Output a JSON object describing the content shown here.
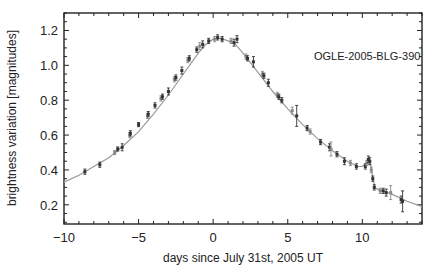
{
  "chart_data": {
    "type": "scatter",
    "title": "",
    "annotation": "OGLE-2005-BLG-390",
    "xlabel": "days since July 31st, 2005 UT",
    "ylabel": "brightness variation [magnitudes]",
    "xlim": [
      -10,
      14
    ],
    "ylim": [
      0.09,
      1.3
    ],
    "xticks": [
      -10,
      -5,
      0,
      5,
      10
    ],
    "xtick_labels": [
      "−10",
      "−5",
      "0",
      "5",
      "10"
    ],
    "yticks": [
      0.2,
      0.4,
      0.6,
      0.8,
      1.0,
      1.2
    ],
    "ytick_labels": [
      "0.2",
      "0.4",
      "0.6",
      "0.8",
      "1.0",
      "1.2"
    ],
    "grid": false,
    "legend": null,
    "series": [
      {
        "name": "observations",
        "style": "points with error bars",
        "points": [
          {
            "x": -8.6,
            "y": 0.39,
            "err": 0.015
          },
          {
            "x": -7.6,
            "y": 0.43,
            "err": 0.015
          },
          {
            "x": -6.6,
            "y": 0.5,
            "err": 0.012
          },
          {
            "x": -6.4,
            "y": 0.52,
            "err": 0.012
          },
          {
            "x": -6.1,
            "y": 0.53,
            "err": 0.02
          },
          {
            "x": -5.6,
            "y": 0.6,
            "err": 0.015
          },
          {
            "x": -5.55,
            "y": 0.61,
            "err": 0.015
          },
          {
            "x": -5.0,
            "y": 0.66,
            "err": 0.012
          },
          {
            "x": -4.4,
            "y": 0.71,
            "err": 0.015
          },
          {
            "x": -4.35,
            "y": 0.72,
            "err": 0.015
          },
          {
            "x": -3.9,
            "y": 0.77,
            "err": 0.015
          },
          {
            "x": -3.5,
            "y": 0.81,
            "err": 0.015
          },
          {
            "x": -3.4,
            "y": 0.82,
            "err": 0.015
          },
          {
            "x": -3.0,
            "y": 0.85,
            "err": 0.02
          },
          {
            "x": -2.6,
            "y": 0.92,
            "err": 0.015
          },
          {
            "x": -2.5,
            "y": 0.93,
            "err": 0.015
          },
          {
            "x": -2.1,
            "y": 0.97,
            "err": 0.02
          },
          {
            "x": -1.7,
            "y": 1.03,
            "err": 0.015
          },
          {
            "x": -1.6,
            "y": 1.04,
            "err": 0.015
          },
          {
            "x": -1.1,
            "y": 1.09,
            "err": 0.015
          },
          {
            "x": -0.9,
            "y": 1.11,
            "err": 0.02
          },
          {
            "x": -0.7,
            "y": 1.12,
            "err": 0.02
          },
          {
            "x": -0.3,
            "y": 1.14,
            "err": 0.015
          },
          {
            "x": 0.1,
            "y": 1.15,
            "err": 0.015
          },
          {
            "x": 0.3,
            "y": 1.16,
            "err": 0.015
          },
          {
            "x": 0.6,
            "y": 1.15,
            "err": 0.015
          },
          {
            "x": 1.2,
            "y": 1.14,
            "err": 0.015
          },
          {
            "x": 1.4,
            "y": 1.13,
            "err": 0.02
          },
          {
            "x": 1.6,
            "y": 1.15,
            "err": 0.02
          },
          {
            "x": 2.2,
            "y": 1.05,
            "err": 0.015
          },
          {
            "x": 2.3,
            "y": 1.04,
            "err": 0.015
          },
          {
            "x": 2.7,
            "y": 1.02,
            "err": 0.03
          },
          {
            "x": 3.3,
            "y": 0.95,
            "err": 0.015
          },
          {
            "x": 3.4,
            "y": 0.94,
            "err": 0.015
          },
          {
            "x": 3.7,
            "y": 0.9,
            "err": 0.02
          },
          {
            "x": 4.3,
            "y": 0.83,
            "err": 0.015
          },
          {
            "x": 4.4,
            "y": 0.82,
            "err": 0.015
          },
          {
            "x": 4.6,
            "y": 0.8,
            "err": 0.015
          },
          {
            "x": 5.3,
            "y": 0.74,
            "err": 0.02
          },
          {
            "x": 5.6,
            "y": 0.71,
            "err": 0.06
          },
          {
            "x": 6.3,
            "y": 0.64,
            "err": 0.015
          },
          {
            "x": 6.5,
            "y": 0.62,
            "err": 0.015
          },
          {
            "x": 7.2,
            "y": 0.56,
            "err": 0.015
          },
          {
            "x": 7.8,
            "y": 0.53,
            "err": 0.02
          },
          {
            "x": 7.9,
            "y": 0.52,
            "err": 0.04
          },
          {
            "x": 8.3,
            "y": 0.49,
            "err": 0.015
          },
          {
            "x": 8.8,
            "y": 0.45,
            "err": 0.02
          },
          {
            "x": 9.2,
            "y": 0.44,
            "err": 0.015
          },
          {
            "x": 9.6,
            "y": 0.42,
            "err": 0.015
          },
          {
            "x": 10.2,
            "y": 0.42,
            "err": 0.015
          },
          {
            "x": 10.3,
            "y": 0.44,
            "err": 0.015
          },
          {
            "x": 10.4,
            "y": 0.46,
            "err": 0.02
          },
          {
            "x": 10.5,
            "y": 0.45,
            "err": 0.02
          },
          {
            "x": 10.6,
            "y": 0.4,
            "err": 0.015
          },
          {
            "x": 10.7,
            "y": 0.35,
            "err": 0.015
          },
          {
            "x": 10.8,
            "y": 0.3,
            "err": 0.015
          },
          {
            "x": 11.2,
            "y": 0.28,
            "err": 0.015
          },
          {
            "x": 11.4,
            "y": 0.28,
            "err": 0.015
          },
          {
            "x": 11.6,
            "y": 0.27,
            "err": 0.02
          },
          {
            "x": 11.9,
            "y": 0.27,
            "err": 0.04
          },
          {
            "x": 12.6,
            "y": 0.23,
            "err": 0.02
          },
          {
            "x": 12.7,
            "y": 0.22,
            "err": 0.06
          }
        ]
      },
      {
        "name": "model fit",
        "style": "line",
        "color": "#9a9a9a",
        "points": [
          {
            "x": -10,
            "y": 0.33
          },
          {
            "x": -9,
            "y": 0.37
          },
          {
            "x": -8,
            "y": 0.42
          },
          {
            "x": -7,
            "y": 0.47
          },
          {
            "x": -6,
            "y": 0.54
          },
          {
            "x": -5,
            "y": 0.62
          },
          {
            "x": -4,
            "y": 0.72
          },
          {
            "x": -3,
            "y": 0.83
          },
          {
            "x": -2,
            "y": 0.95
          },
          {
            "x": -1,
            "y": 1.07
          },
          {
            "x": -0.5,
            "y": 1.12
          },
          {
            "x": 0,
            "y": 1.15
          },
          {
            "x": 0.5,
            "y": 1.155
          },
          {
            "x": 1,
            "y": 1.14
          },
          {
            "x": 1.5,
            "y": 1.12
          },
          {
            "x": 2,
            "y": 1.07
          },
          {
            "x": 3,
            "y": 0.96
          },
          {
            "x": 4,
            "y": 0.85
          },
          {
            "x": 5,
            "y": 0.75
          },
          {
            "x": 6,
            "y": 0.66
          },
          {
            "x": 7,
            "y": 0.58
          },
          {
            "x": 8,
            "y": 0.51
          },
          {
            "x": 9,
            "y": 0.45
          },
          {
            "x": 9.7,
            "y": 0.42
          },
          {
            "x": 10.0,
            "y": 0.42
          },
          {
            "x": 10.25,
            "y": 0.44
          },
          {
            "x": 10.45,
            "y": 0.47
          },
          {
            "x": 10.55,
            "y": 0.44
          },
          {
            "x": 10.7,
            "y": 0.35
          },
          {
            "x": 10.85,
            "y": 0.3
          },
          {
            "x": 11,
            "y": 0.29
          },
          {
            "x": 12,
            "y": 0.26
          },
          {
            "x": 13,
            "y": 0.22
          },
          {
            "x": 14,
            "y": 0.19
          }
        ]
      }
    ]
  }
}
